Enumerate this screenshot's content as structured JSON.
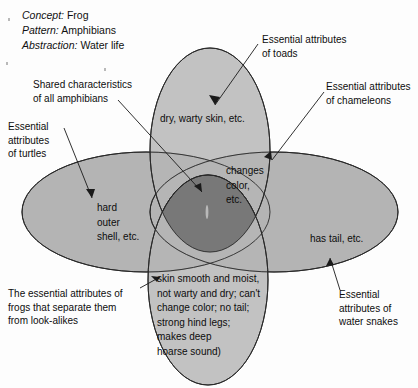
{
  "diagram": {
    "title_lines": [
      {
        "key": "Concept:",
        "value": "Frog"
      },
      {
        "key": "Pattern:",
        "value": "Amphibians"
      },
      {
        "key": "Abstraction:",
        "value": "Water life"
      }
    ],
    "colors": {
      "set_fill": "#b4b4b4",
      "core_fill": "#787878",
      "outline": "#1a1a1a",
      "text": "#0d0d0d",
      "background": "#fdfdfd"
    },
    "sets": [
      {
        "id": "toads",
        "orientation": "vertical",
        "inner_label": "dry, warty skin, etc.",
        "callout": "Essential attributes\nof toads"
      },
      {
        "id": "turtles",
        "orientation": "horizontal",
        "inner_label": "hard\nouter\nshell, etc.",
        "callout": "Essential\nattributes\nof turtles"
      },
      {
        "id": "chameleons",
        "orientation": "horizontal-overlap",
        "inner_label": "changes\ncolor,\netc.",
        "callout": "Essential attributes\nof chameleons"
      },
      {
        "id": "water-snakes",
        "orientation": "horizontal",
        "inner_label": "has tail, etc.",
        "callout": "Essential\nattributes of\nwater snakes"
      },
      {
        "id": "frogs",
        "orientation": "vertical",
        "inner_label": "skin smooth and moist,\nnot warty and dry; can't\nchange color; no tail;\nstrong hind legs;\nmakes deep\nhoarse sound)",
        "callout": "The essential attributes of\nfrogs that separate them\nfrom look-alikes"
      }
    ],
    "core": {
      "callout": "Shared characteristics\nof all amphibians"
    }
  }
}
